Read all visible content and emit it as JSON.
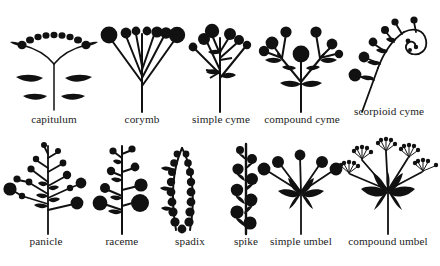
{
  "figure": {
    "background_color": "#ffffff",
    "ink_color": "#111111",
    "title": "",
    "rows": [
      {
        "id": "row-top",
        "items": [
          {
            "id": "capitulum",
            "label": "capitulum",
            "order": 1
          },
          {
            "id": "corymb",
            "label": "corymb",
            "order": 2
          },
          {
            "id": "simple-cyme",
            "label": "simple cyme",
            "order": 3
          },
          {
            "id": "compound-cyme",
            "label": "compound cyme",
            "order": 4
          },
          {
            "id": "scorpioid-cyme",
            "label": "scorpioid cyme",
            "order": 5
          }
        ]
      },
      {
        "id": "row-bottom",
        "items": [
          {
            "id": "panicle",
            "label": "panicle",
            "order": 6
          },
          {
            "id": "raceme",
            "label": "raceme",
            "order": 7
          },
          {
            "id": "spadix",
            "label": "spadix",
            "order": 8
          },
          {
            "id": "spike",
            "label": "spike",
            "order": 9
          },
          {
            "id": "simple-umbel",
            "label": "simple umbel",
            "order": 10
          },
          {
            "id": "compound-umbel",
            "label": "compound umbel",
            "order": 11
          }
        ]
      }
    ]
  }
}
